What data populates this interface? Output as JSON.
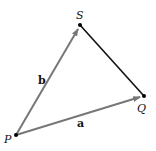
{
  "diagram": {
    "points": {
      "P": {
        "label": "P",
        "x": 16,
        "y": 135
      },
      "S": {
        "label": "S",
        "x": 80,
        "y": 25
      },
      "Q": {
        "label": "Q",
        "x": 144,
        "y": 96
      }
    },
    "vectors": [
      {
        "name": "b",
        "label": "b",
        "from": "P",
        "to": "S",
        "color": "#777777"
      },
      {
        "name": "a",
        "label": "a",
        "from": "P",
        "to": "Q",
        "color": "#777777"
      }
    ],
    "segments": [
      {
        "from": "S",
        "to": "Q",
        "color": "#111111"
      }
    ]
  }
}
